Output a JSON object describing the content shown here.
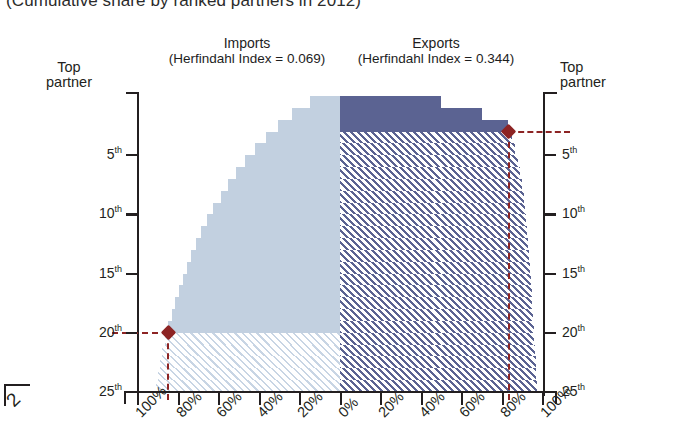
{
  "subtitle": "(Cumulative share by ranked partners in 2012)",
  "panels": {
    "imports": {
      "name": "Imports",
      "hhi_text": "(Herfindahl Index = 0.069)",
      "hhi_value": 0.069,
      "color": "#c2d0e0"
    },
    "exports": {
      "name": "Exports",
      "hhi_text": "(Herfindahl Index = 0.344)",
      "hhi_value": 0.344,
      "color": "#5b6392"
    }
  },
  "axes": {
    "y_top_label_line1": "Top",
    "y_top_label_line2": "partner",
    "y_ticks": [
      "5",
      "10",
      "15",
      "20",
      "25"
    ],
    "y_suffix": "th",
    "x_left_ticks": [
      "100%",
      "80%",
      "60%",
      "40%",
      "20%",
      "0%"
    ],
    "x_right_ticks": [
      "0%",
      "20%",
      "40%",
      "60%",
      "80%",
      "100%"
    ]
  },
  "annotation": {
    "color": "#8d2424",
    "imports_marker_rank": "20th",
    "imports_marker_share": "85%",
    "exports_marker_rank": "3rd",
    "exports_marker_share": "83%"
  },
  "year_cut_label": "2",
  "chart_data": {
    "type": "area",
    "title": "(Cumulative share by ranked partners in 2012)",
    "xlabel": "",
    "ylabel": "Ranked partner",
    "orientation": "mirrored-horizontal",
    "grid": false,
    "legend": "none",
    "xlim_left": [
      100,
      0
    ],
    "xlim_right": [
      0,
      100
    ],
    "y_categories": [
      "Top partner",
      "2nd",
      "3rd",
      "4th",
      "5th",
      "6th",
      "7th",
      "8th",
      "9th",
      "10th",
      "11th",
      "12th",
      "13th",
      "14th",
      "15th",
      "16th",
      "17th",
      "18th",
      "19th",
      "20th",
      "21st",
      "22nd",
      "23rd",
      "24th",
      "25th"
    ],
    "series": [
      {
        "name": "Imports",
        "side": "left",
        "color": "#c2d0e0",
        "herfindahl_index": 0.069,
        "cumulative_share_pct": [
          15.0,
          23.5,
          30.5,
          36.5,
          42.0,
          47.0,
          51.5,
          55.5,
          59.0,
          62.5,
          65.5,
          68.5,
          71.0,
          73.5,
          75.5,
          77.5,
          79.5,
          81.5,
          83.0,
          85.0,
          86.5,
          88.0,
          89.0,
          90.0,
          91.0
        ],
        "solid_through_rank": 20,
        "hatched_from_rank": 21
      },
      {
        "name": "Exports",
        "side": "right",
        "color": "#5b6392",
        "herfindahl_index": 0.344,
        "cumulative_share_pct": [
          50.0,
          70.0,
          83.0,
          85.0,
          86.5,
          88.0,
          89.0,
          90.0,
          90.8,
          91.5,
          92.0,
          92.5,
          93.0,
          93.5,
          94.0,
          94.3,
          94.6,
          95.0,
          95.3,
          95.6,
          96.0,
          96.3,
          96.6,
          97.0,
          97.3
        ],
        "solid_through_rank": 3,
        "hatched_from_rank": 4
      }
    ],
    "markers": [
      {
        "series": "Imports",
        "rank": 20,
        "share_pct": 85.0,
        "shape": "diamond",
        "color": "#8d2424"
      },
      {
        "series": "Exports",
        "rank": 3,
        "share_pct": 83.0,
        "shape": "diamond",
        "color": "#8d2424"
      }
    ]
  }
}
